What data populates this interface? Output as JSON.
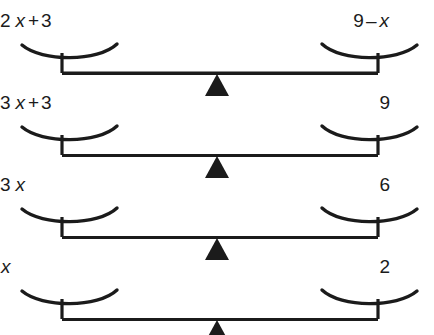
{
  "figure": {
    "kind": "balance-scale-sequence",
    "title_fragment": "",
    "ink_color": "#1b1b1b",
    "background_color": "#ffffff",
    "scale_count": 4
  },
  "scales": [
    {
      "index": 1,
      "left_expression": {
        "text": "2 x + 3",
        "tokens": [
          {
            "t": "2",
            "italic": false
          },
          {
            "t": "x",
            "italic": true
          },
          {
            "t": "+",
            "italic": false,
            "op": true
          },
          {
            "t": "3",
            "italic": false
          }
        ]
      },
      "right_expression": {
        "text": "9 – x",
        "tokens": [
          {
            "t": "9",
            "italic": false
          },
          {
            "t": "–",
            "italic": false,
            "op": true
          },
          {
            "t": "x",
            "italic": true
          }
        ]
      }
    },
    {
      "index": 2,
      "left_expression": {
        "text": "3 x + 3",
        "tokens": [
          {
            "t": "3",
            "italic": false
          },
          {
            "t": "x",
            "italic": true
          },
          {
            "t": "+",
            "italic": false,
            "op": true
          },
          {
            "t": "3",
            "italic": false
          }
        ]
      },
      "right_expression": {
        "text": "9",
        "tokens": [
          {
            "t": "9",
            "italic": false
          }
        ]
      }
    },
    {
      "index": 3,
      "left_expression": {
        "text": "3 x",
        "tokens": [
          {
            "t": "3",
            "italic": false
          },
          {
            "t": "x",
            "italic": true
          }
        ]
      },
      "right_expression": {
        "text": "6",
        "tokens": [
          {
            "t": "6",
            "italic": false
          }
        ]
      }
    },
    {
      "index": 4,
      "left_expression": {
        "text": "x",
        "tokens": [
          {
            "t": "x",
            "italic": true
          }
        ]
      },
      "right_expression": {
        "text": "2",
        "tokens": [
          {
            "t": "2",
            "italic": false
          }
        ]
      }
    }
  ],
  "label_layout": {
    "left_right_edges_px": [
      122,
      122,
      134,
      152
    ],
    "right_right_edges_px": [
      390,
      390,
      390,
      390
    ],
    "label_tops_px": [
      10,
      92,
      174,
      256
    ]
  }
}
